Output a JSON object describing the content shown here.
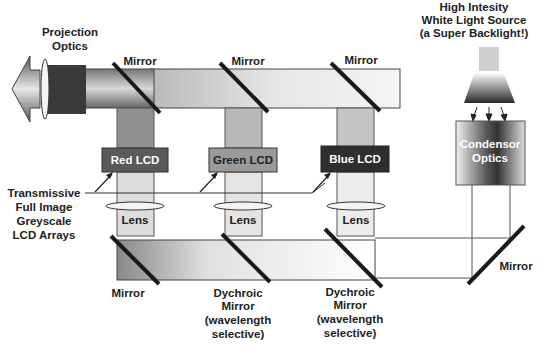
{
  "labels": {
    "projection_optics": [
      "Projection",
      "Optics"
    ],
    "light_source": [
      "High Intesity",
      "White Light Source",
      "(a Super Backlight!)"
    ],
    "condensor_optics": [
      "Condensor",
      "Optics"
    ],
    "transmissive": [
      "Transmissive",
      "Full Image",
      "Greyscale",
      "LCD Arrays"
    ],
    "mirror_top_1": "Mirror",
    "mirror_top_2": "Mirror",
    "mirror_top_3": "Mirror",
    "mirror_bottom_left": "Mirror",
    "mirror_right": "Mirror",
    "dichroic_1": [
      "Dychroic",
      "Mirror",
      "(wavelength",
      "selective)"
    ],
    "dichroic_2": [
      "Dychroic",
      "Mirror",
      "(wavelength",
      "selective)"
    ],
    "lens": "Lens"
  },
  "lcds": [
    {
      "label": "Red LCD",
      "fill": "#5a5a5a",
      "text_color": "#ffffff"
    },
    {
      "label": "Green LCD",
      "fill": "#9a9a9a",
      "text_color": "#222222"
    },
    {
      "label": "Blue LCD",
      "fill": "#2e2e2e",
      "text_color": "#ffffff"
    }
  ],
  "lenses": [
    "Lens",
    "Lens",
    "Lens"
  ],
  "colors": {
    "mirror": "#1a1a1a",
    "beam_light": "#eeeeee",
    "beam_mid": "#c8c8c8",
    "outline": "#333333"
  }
}
